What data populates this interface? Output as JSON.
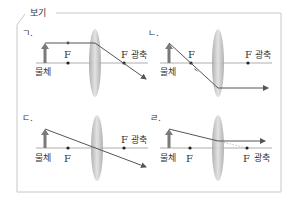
{
  "box": {
    "title": "보기"
  },
  "panels": [
    {
      "id": "a",
      "label": "ㄱ.",
      "object_label": "물체",
      "focus_left": "F",
      "focus_right": "F",
      "axis_label": "광축"
    },
    {
      "id": "b",
      "label": "ㄴ.",
      "object_label": "물체",
      "focus_left": "F",
      "focus_right": "F",
      "axis_label": "광축"
    },
    {
      "id": "c",
      "label": "ㄷ.",
      "object_label": "물체",
      "focus_left": "F",
      "focus_right": "F",
      "axis_label": "광축"
    },
    {
      "id": "d",
      "label": "ㄹ.",
      "object_label": "물체",
      "focus_left": "F",
      "focus_right": "F",
      "axis_label": "광축"
    }
  ],
  "colors": {
    "frame": "#c8c8c8",
    "axis": "#9a9a9a",
    "ray": "#555555",
    "object": "#7a7a7a",
    "lens_edge": "#b4b4b4",
    "lens_center": "#d8d8d8"
  }
}
